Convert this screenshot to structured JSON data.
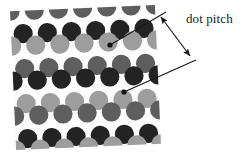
{
  "figure": {
    "background_color": "#ffffff",
    "panel": {
      "x": 13,
      "y": 8,
      "width": 145,
      "height": 139,
      "background_color": "#fdfdfd"
    },
    "grid": {
      "horizontal_pitch": 24.2,
      "vertical_pitch": 23.2,
      "dot_radius": 9.6,
      "row_offset": 12.1,
      "rotation_deg": -2.5
    },
    "tones": {
      "dark": "#232323",
      "mid": "#5e5e5e",
      "light": "#9d9d9d"
    },
    "rows": [
      {
        "y": 8,
        "offset": 0,
        "tones": [
          "mid",
          "mid",
          "mid",
          "mid",
          "mid",
          "mid",
          "mid"
        ]
      },
      {
        "y": 31,
        "offset": 12.1,
        "tones": [
          "dark",
          "dark",
          "dark",
          "dark",
          "dark",
          "dark"
        ]
      },
      {
        "y": 43,
        "offset": 0,
        "tones": [
          "light",
          "light",
          "light",
          "light",
          "light",
          "light",
          "light"
        ]
      },
      {
        "y": 66,
        "offset": 12.1,
        "tones": [
          "mid",
          "mid",
          "mid",
          "mid",
          "mid",
          "mid"
        ]
      },
      {
        "y": 78,
        "offset": 0,
        "tones": [
          "dark",
          "dark",
          "dark",
          "dark",
          "dark",
          "dark",
          "dark"
        ]
      },
      {
        "y": 101,
        "offset": 12.1,
        "tones": [
          "light",
          "light",
          "light",
          "light",
          "light",
          "light"
        ]
      },
      {
        "y": 113,
        "offset": 0,
        "tones": [
          "mid",
          "mid",
          "mid",
          "mid",
          "mid",
          "mid",
          "mid"
        ]
      },
      {
        "y": 136,
        "offset": 12.1,
        "tones": [
          "dark",
          "dark",
          "dark",
          "dark",
          "dark",
          "dark"
        ]
      },
      {
        "y": 147,
        "offset": 0,
        "tones": [
          "light",
          "light",
          "light",
          "light",
          "light",
          "light",
          "light"
        ]
      }
    ],
    "marked_dots": [
      {
        "cx": 110,
        "cy": 45,
        "tone": "light",
        "marker_radius": 2.6,
        "marker_color": "#111111"
      },
      {
        "cx": 124,
        "cy": 92,
        "tone": "mid",
        "marker_radius": 2.6,
        "marker_color": "#111111"
      }
    ],
    "leader_lines": [
      {
        "x1": 110,
        "y1": 45,
        "x2": 166,
        "y2": 12,
        "color": "#1a1a1a",
        "width": 1.1
      },
      {
        "x1": 124,
        "y1": 92,
        "x2": 196,
        "y2": 60,
        "color": "#1a1a1a",
        "width": 1.1
      }
    ],
    "dimension_arrow": {
      "x1": 161,
      "y1": 17,
      "x2": 190,
      "y2": 56,
      "color": "#1a1a1a",
      "width": 1.2,
      "double_headed": true,
      "head_length": 7,
      "head_width": 5
    },
    "label": {
      "text": "dot pitch",
      "x": 186,
      "y": 11,
      "font_size": 13,
      "color": "#1a1a1a"
    }
  }
}
